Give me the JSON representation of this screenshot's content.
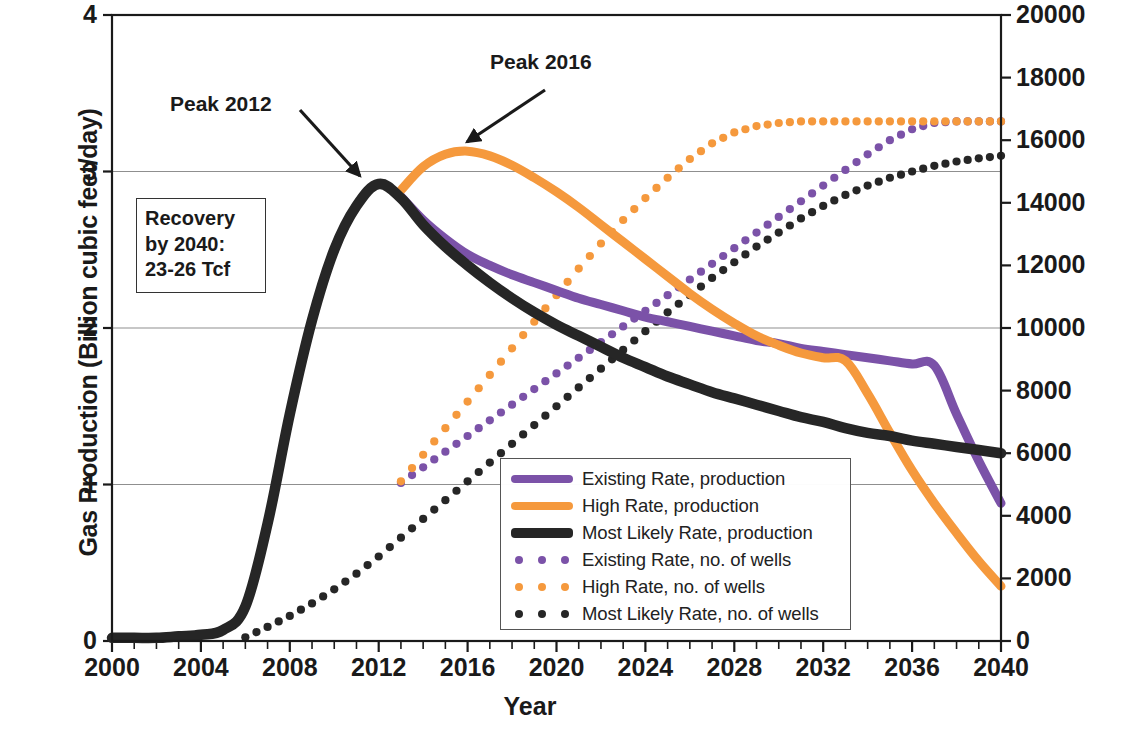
{
  "chart_data": {
    "type": "line",
    "title": "",
    "xlabel": "Year",
    "ylabel": "Gas Production (Billion cubic feet/day)",
    "ylabel_right": "Number of Producing Wells",
    "xlim": [
      2000,
      2040
    ],
    "ylim": [
      0,
      4
    ],
    "ylim_right": [
      0,
      20000
    ],
    "xticks": [
      2000,
      2004,
      2008,
      2012,
      2016,
      2020,
      2024,
      2028,
      2032,
      2036,
      2040
    ],
    "xtick_minor_step": 1,
    "yticks_left": [
      0,
      1,
      2,
      3,
      4
    ],
    "yticks_right": [
      0,
      2000,
      4000,
      6000,
      8000,
      10000,
      12000,
      14000,
      16000,
      18000,
      20000
    ],
    "grid": "horizontal gridlines at y = 1, 2, 3",
    "legend_position": "lower center-right, inside axes, boxed",
    "colors": {
      "existing_rate": "#7b52a8",
      "high_rate": "#f5993d",
      "most_likely_rate": "#262626",
      "axis": "#1a1a1a",
      "gridline": "#8f8f8f"
    },
    "series": [
      {
        "name": "Existing Rate, production",
        "axis": "left",
        "style": "solid",
        "color": "#7b52a8",
        "x": [
          2013,
          2014,
          2015,
          2016,
          2017,
          2018,
          2019,
          2020,
          2021,
          2022,
          2023,
          2024,
          2025,
          2026,
          2027,
          2028,
          2029,
          2030,
          2031,
          2032,
          2033,
          2034,
          2035,
          2036,
          2037,
          2038,
          2039,
          2040
        ],
        "y": [
          2.84,
          2.69,
          2.57,
          2.47,
          2.4,
          2.34,
          2.29,
          2.24,
          2.19,
          2.15,
          2.11,
          2.07,
          2.04,
          2.01,
          1.98,
          1.95,
          1.92,
          1.9,
          1.87,
          1.85,
          1.83,
          1.81,
          1.79,
          1.77,
          1.76,
          1.45,
          1.15,
          0.88
        ]
      },
      {
        "name": "High Rate, production",
        "axis": "left",
        "style": "solid",
        "color": "#f5993d",
        "x": [
          2013,
          2014,
          2015,
          2016,
          2017,
          2018,
          2019,
          2020,
          2021,
          2022,
          2023,
          2024,
          2025,
          2026,
          2027,
          2028,
          2029,
          2030,
          2031,
          2032,
          2033,
          2034,
          2035,
          2036,
          2037,
          2038,
          2039,
          2040
        ],
        "y": [
          2.88,
          3.03,
          3.11,
          3.13,
          3.1,
          3.04,
          2.96,
          2.87,
          2.77,
          2.66,
          2.55,
          2.44,
          2.33,
          2.22,
          2.12,
          2.03,
          1.95,
          1.89,
          1.84,
          1.81,
          1.79,
          1.58,
          1.33,
          1.09,
          0.88,
          0.69,
          0.51,
          0.35
        ]
      },
      {
        "name": "Most Likely Rate, production",
        "axis": "left",
        "style": "solid",
        "color": "#262626",
        "x": [
          2000,
          2001,
          2002,
          2003,
          2004,
          2005,
          2006,
          2007,
          2008,
          2009,
          2010,
          2011,
          2012,
          2013,
          2014,
          2015,
          2016,
          2017,
          2018,
          2019,
          2020,
          2021,
          2022,
          2023,
          2024,
          2025,
          2026,
          2027,
          2028,
          2029,
          2030,
          2031,
          2032,
          2033,
          2034,
          2035,
          2036,
          2037,
          2038,
          2039,
          2040
        ],
        "y": [
          0.02,
          0.02,
          0.02,
          0.03,
          0.04,
          0.07,
          0.22,
          0.75,
          1.45,
          2.05,
          2.5,
          2.78,
          2.92,
          2.83,
          2.66,
          2.52,
          2.4,
          2.29,
          2.19,
          2.1,
          2.02,
          1.95,
          1.88,
          1.81,
          1.75,
          1.69,
          1.64,
          1.59,
          1.55,
          1.51,
          1.47,
          1.43,
          1.4,
          1.36,
          1.33,
          1.31,
          1.28,
          1.26,
          1.24,
          1.22,
          1.2
        ]
      },
      {
        "name": "Existing Rate, no. of wells",
        "axis": "right",
        "style": "dotted",
        "color": "#7b52a8",
        "x": [
          2013,
          2014,
          2015,
          2016,
          2017,
          2018,
          2019,
          2020,
          2021,
          2022,
          2023,
          2024,
          2025,
          2026,
          2027,
          2028,
          2029,
          2030,
          2031,
          2032,
          2033,
          2034,
          2035,
          2036,
          2037,
          2038,
          2039,
          2040
        ],
        "y": [
          5050,
          5550,
          6050,
          6550,
          7050,
          7550,
          8050,
          8550,
          9050,
          9550,
          10050,
          10550,
          11050,
          11550,
          12050,
          12550,
          13050,
          13550,
          14050,
          14550,
          15050,
          15550,
          16000,
          16350,
          16550,
          16600,
          16600,
          16600
        ]
      },
      {
        "name": "High Rate, no. of wells",
        "axis": "right",
        "style": "dotted",
        "color": "#f5993d",
        "x": [
          2013,
          2014,
          2015,
          2016,
          2017,
          2018,
          2019,
          2020,
          2021,
          2022,
          2023,
          2024,
          2025,
          2026,
          2027,
          2028,
          2029,
          2030,
          2031,
          2032,
          2033,
          2034,
          2035,
          2036,
          2037,
          2038,
          2039,
          2040
        ],
        "y": [
          5100,
          5950,
          6800,
          7650,
          8500,
          9350,
          10200,
          11050,
          11900,
          12700,
          13450,
          14150,
          14800,
          15400,
          15900,
          16250,
          16450,
          16550,
          16600,
          16600,
          16600,
          16600,
          16600,
          16600,
          16600,
          16600,
          16600,
          16600
        ]
      },
      {
        "name": "Most Likely Rate, no. of wells",
        "axis": "right",
        "style": "dotted",
        "color": "#262626",
        "x": [
          2006,
          2007,
          2008,
          2009,
          2010,
          2011,
          2012,
          2013,
          2014,
          2015,
          2016,
          2017,
          2018,
          2019,
          2020,
          2021,
          2022,
          2023,
          2024,
          2025,
          2026,
          2027,
          2028,
          2029,
          2030,
          2031,
          2032,
          2033,
          2034,
          2035,
          2036,
          2037,
          2038,
          2039,
          2040
        ],
        "y": [
          120,
          450,
          800,
          1200,
          1650,
          2150,
          2700,
          3300,
          3900,
          4500,
          5100,
          5700,
          6300,
          6900,
          7500,
          8100,
          8700,
          9300,
          9900,
          10500,
          11050,
          11600,
          12100,
          12600,
          13050,
          13500,
          13900,
          14250,
          14550,
          14800,
          15000,
          15180,
          15320,
          15420,
          15500
        ]
      }
    ],
    "annotations": [
      {
        "name": "peak-2012",
        "text": "Peak 2012",
        "points_to_x": 2012,
        "points_to_y": 2.92
      },
      {
        "name": "peak-2016",
        "text": "Peak 2016",
        "points_to_x": 2016,
        "points_to_y": 3.13
      },
      {
        "name": "recovery-box",
        "lines": [
          "Recovery",
          "by 2040:",
          "23-26 Tcf"
        ]
      }
    ]
  },
  "axes": {
    "left_label": "Gas Production (Billion cubic feet/day)",
    "right_label": "Number of Producing Wells",
    "x_label": "Year",
    "left_ticks": [
      "4",
      "3",
      "2",
      "1",
      "0"
    ],
    "right_ticks": [
      "20000",
      "18000",
      "16000",
      "14000",
      "12000",
      "10000",
      "8000",
      "6000",
      "4000",
      "2000",
      "0"
    ],
    "x_ticks": [
      "2000",
      "2004",
      "2008",
      "2012",
      "2016",
      "2020",
      "2024",
      "2028",
      "2032",
      "2036",
      "2040"
    ]
  },
  "annotations": {
    "peak_2012": "Peak 2012",
    "peak_2016": "Peak 2016",
    "recovery_line1": "Recovery",
    "recovery_line2": "by 2040:",
    "recovery_line3": "23-26 Tcf"
  },
  "legend": {
    "items": [
      {
        "label": "Existing Rate, production",
        "color": "#7b52a8",
        "style": "solid"
      },
      {
        "label": "High Rate, production",
        "color": "#f5993d",
        "style": "solid"
      },
      {
        "label": "Most Likely Rate, production",
        "color": "#262626",
        "style": "solid"
      },
      {
        "label": "Existing Rate, no. of wells",
        "color": "#7b52a8",
        "style": "dotted"
      },
      {
        "label": "High Rate, no. of wells",
        "color": "#f5993d",
        "style": "dotted"
      },
      {
        "label": "Most Likely Rate, no. of wells",
        "color": "#262626",
        "style": "dotted"
      }
    ]
  }
}
